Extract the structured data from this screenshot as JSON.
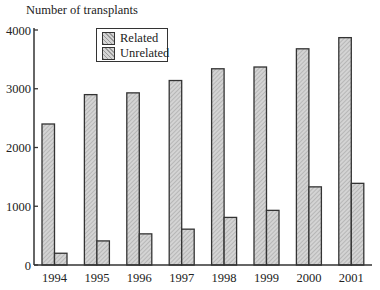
{
  "chart_data": {
    "type": "bar",
    "title": "",
    "ylabel": "Number of transplants",
    "xlabel": "",
    "categories": [
      "1994",
      "1995",
      "1996",
      "1997",
      "1998",
      "1999",
      "2000",
      "2001"
    ],
    "series": [
      {
        "name": "Related",
        "values": [
          2400,
          2900,
          2930,
          3140,
          3340,
          3370,
          3680,
          3870
        ]
      },
      {
        "name": "Unrelated",
        "values": [
          200,
          410,
          530,
          610,
          810,
          930,
          1330,
          1390
        ]
      }
    ],
    "ylim": [
      0,
      4000
    ],
    "yticks": [
      0,
      1000,
      2000,
      3000,
      4000
    ],
    "grid": false,
    "legend_position": "upper-left-inside",
    "legend": [
      "Related",
      "Unrelated"
    ]
  },
  "colors": {
    "bar_fill": "#d4d4d4",
    "bar_hatch": "#9a9a9a",
    "bar_edge": "#333333",
    "axis": "#333333"
  }
}
